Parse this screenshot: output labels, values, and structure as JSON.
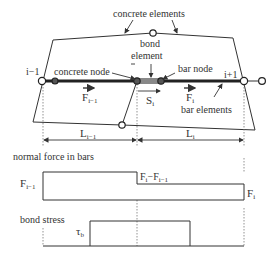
{
  "diagram": {
    "labels": {
      "concrete_elements": "concrete elements",
      "bond_element_line1": "bond",
      "bond_element_line2": "element",
      "concrete_node": "concrete node",
      "bar_node": "bar node",
      "bar_elements": "bar elements",
      "node_left": "i−1",
      "node_right": "i+1",
      "force_left": "F",
      "force_left_sub": "i−1",
      "force_right": "F",
      "force_right_sub": "i",
      "slip": "S",
      "slip_sub": "i",
      "length_left": "L",
      "length_left_sub": "i−1",
      "length_right": "L",
      "length_right_sub": "i"
    },
    "normal_force_chart": {
      "title": "normal force in bars",
      "left_label": "F",
      "left_label_sub": "i−1",
      "diff_label": "F",
      "diff_label_sub1": "i",
      "diff_label_minus": "−F",
      "diff_label_sub2": "i−1",
      "right_label": "F",
      "right_label_sub": "i"
    },
    "bond_stress_chart": {
      "title": "bond stress",
      "value_label": "τ",
      "value_label_sub": "b"
    },
    "colors": {
      "line": "#333333",
      "bar": "#222222",
      "dim": "#555555"
    }
  }
}
